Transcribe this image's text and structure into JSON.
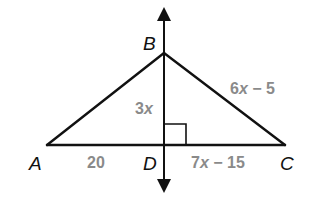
{
  "diagram": {
    "type": "geometry-triangle-with-perpendicular-bisector",
    "points": {
      "A": {
        "label": "A",
        "x": 47,
        "y": 145
      },
      "B": {
        "label": "B",
        "x": 164,
        "y": 53
      },
      "C": {
        "label": "C",
        "x": 285,
        "y": 145
      },
      "D": {
        "label": "D",
        "x": 164,
        "y": 145
      }
    },
    "segments": [
      {
        "from": "A",
        "to": "B"
      },
      {
        "from": "B",
        "to": "C"
      },
      {
        "from": "A",
        "to": "C"
      }
    ],
    "perpendicular_line": {
      "through": [
        "B",
        "D"
      ],
      "arrows": "both",
      "top_y": 5,
      "bottom_y": 195
    },
    "right_angle_marker": {
      "at": "D",
      "size": 21
    },
    "measures": {
      "AD": {
        "text_coef": "20",
        "text_var": "",
        "text_rest": ""
      },
      "DC": {
        "text_coef": "7",
        "text_var": "x",
        "text_rest": " − 15"
      },
      "BD": {
        "text_coef": "3",
        "text_var": "x",
        "text_rest": ""
      },
      "BC": {
        "text_coef": "6",
        "text_var": "x",
        "text_rest": " − 5"
      }
    },
    "colors": {
      "line": "#111111",
      "measure_text": "#8a8a8a",
      "point_text": "#111111",
      "background": "#ffffff"
    }
  }
}
